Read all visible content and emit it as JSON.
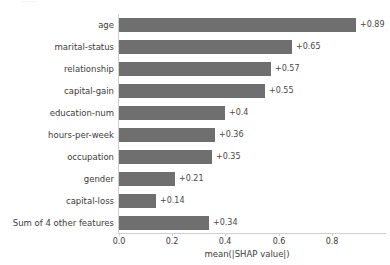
{
  "figure": {
    "clipped_top_text": "......",
    "bar_color": "#6f6f6f",
    "label_color": "#3c3c3c",
    "value_color": "#484848",
    "axis_color": "#cfcfcf",
    "background": "#ffffff"
  },
  "chart_data": {
    "type": "bar",
    "orientation": "horizontal",
    "title": "",
    "xlabel": "mean(|SHAP value|)",
    "ylabel": "",
    "xlim": [
      0.0,
      0.95
    ],
    "grid": false,
    "legend": null,
    "categories": [
      "age",
      "marital-status",
      "relationship",
      "capital-gain",
      "education-num",
      "hours-per-week",
      "occupation",
      "gender",
      "capital-loss",
      "Sum of 4 other features"
    ],
    "values": [
      0.89,
      0.65,
      0.57,
      0.55,
      0.4,
      0.36,
      0.35,
      0.21,
      0.14,
      0.34
    ],
    "data_labels": [
      "+0.89",
      "+0.65",
      "+0.57",
      "+0.55",
      "+0.4",
      "+0.36",
      "+0.35",
      "+0.21",
      "+0.14",
      "+0.34"
    ],
    "xticks": [
      0.0,
      0.2,
      0.4,
      0.6,
      0.8
    ],
    "xticklabels": [
      "0.0",
      "0.2",
      "0.4",
      "0.6",
      "0.8"
    ]
  }
}
